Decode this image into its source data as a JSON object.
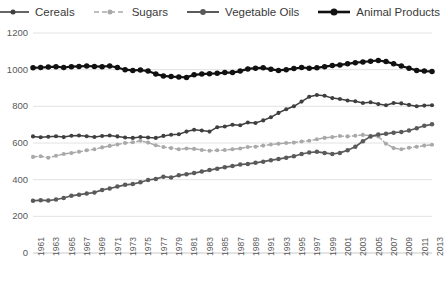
{
  "chart_data": {
    "type": "line",
    "title": "",
    "xlabel": "",
    "ylabel": "",
    "xlim": [
      1961,
      2013
    ],
    "ylim": [
      0,
      1200
    ],
    "ytick_step": 200,
    "yticks": [
      0,
      200,
      400,
      600,
      800,
      1000,
      1200
    ],
    "xtick_step": 2,
    "grid": true,
    "legend_position": "top",
    "x": [
      1961,
      1962,
      1963,
      1964,
      1965,
      1966,
      1967,
      1968,
      1969,
      1970,
      1971,
      1972,
      1973,
      1974,
      1975,
      1976,
      1977,
      1978,
      1979,
      1980,
      1981,
      1982,
      1983,
      1984,
      1985,
      1986,
      1987,
      1988,
      1989,
      1990,
      1991,
      1992,
      1993,
      1994,
      1995,
      1996,
      1997,
      1998,
      1999,
      2000,
      2001,
      2002,
      2003,
      2004,
      2005,
      2006,
      2007,
      2008,
      2009,
      2010,
      2011,
      2012,
      2013
    ],
    "xtick_labels": [
      "1961",
      "1963",
      "1965",
      "1967",
      "1969",
      "1971",
      "1973",
      "1975",
      "1977",
      "1979",
      "1981",
      "1983",
      "1985",
      "1987",
      "1989",
      "1991",
      "1993",
      "1995",
      "1997",
      "1999",
      "2001",
      "2003",
      "2005",
      "2007",
      "2009",
      "2011",
      "2013"
    ],
    "series": [
      {
        "name": "Cereals",
        "color": "#3f3f3f",
        "style": "solid",
        "marker": "circle",
        "values": [
          636,
          631,
          634,
          637,
          632,
          640,
          641,
          637,
          633,
          638,
          641,
          636,
          630,
          628,
          633,
          630,
          628,
          639,
          645,
          648,
          662,
          672,
          668,
          662,
          686,
          690,
          700,
          697,
          712,
          709,
          723,
          740,
          764,
          784,
          800,
          826,
          852,
          862,
          858,
          845,
          840,
          832,
          828,
          818,
          822,
          812,
          806,
          818,
          816,
          808,
          800,
          804,
          806
        ]
      },
      {
        "name": "Sugars",
        "color": "#a9a9a9",
        "style": "dashed",
        "marker": "circle",
        "values": [
          524,
          528,
          520,
          530,
          540,
          545,
          552,
          560,
          566,
          576,
          584,
          592,
          600,
          604,
          612,
          602,
          588,
          578,
          572,
          566,
          570,
          568,
          562,
          558,
          560,
          562,
          566,
          570,
          578,
          580,
          586,
          592,
          596,
          600,
          602,
          608,
          612,
          620,
          628,
          632,
          638,
          636,
          640,
          644,
          640,
          636,
          596,
          572,
          566,
          574,
          580,
          586,
          590
        ]
      },
      {
        "name": "Vegetable Oils",
        "color": "#5a5a5a",
        "style": "solid",
        "marker": "circle",
        "values": [
          285,
          288,
          286,
          292,
          300,
          312,
          318,
          324,
          330,
          344,
          352,
          362,
          372,
          376,
          386,
          398,
          404,
          416,
          412,
          424,
          430,
          436,
          444,
          452,
          460,
          468,
          474,
          482,
          486,
          492,
          498,
          506,
          512,
          520,
          528,
          540,
          548,
          552,
          546,
          540,
          546,
          560,
          580,
          610,
          636,
          646,
          650,
          656,
          660,
          668,
          680,
          694,
          702
        ]
      },
      {
        "name": "Animal Products",
        "color": "#111111",
        "style": "solid",
        "marker": "circle",
        "values": [
          1010,
          1012,
          1014,
          1016,
          1012,
          1016,
          1018,
          1020,
          1018,
          1016,
          1020,
          1012,
          1000,
          996,
          998,
          992,
          976,
          966,
          962,
          960,
          958,
          972,
          976,
          978,
          980,
          984,
          984,
          992,
          1004,
          1008,
          1010,
          1002,
          996,
          1000,
          1006,
          1012,
          1008,
          1010,
          1016,
          1022,
          1026,
          1032,
          1038,
          1042,
          1046,
          1050,
          1044,
          1032,
          1020,
          1008,
          996,
          992,
          990
        ]
      }
    ]
  },
  "axes": {
    "y_axis_name": "value-axis",
    "x_axis_name": "year-axis"
  }
}
